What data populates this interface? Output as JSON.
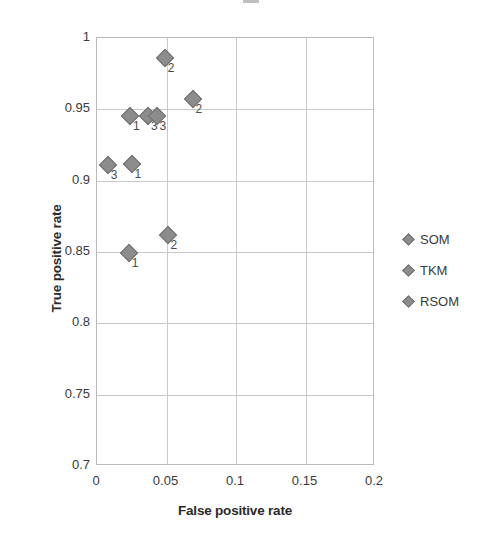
{
  "chart_data": {
    "type": "scatter",
    "title": "",
    "xlabel": "False positive rate",
    "ylabel": "True positive rate",
    "xlim": [
      0,
      0.2
    ],
    "ylim": [
      0.7,
      1
    ],
    "xticks": [
      "0",
      "0.05",
      "0.1",
      "0.15",
      "0.2"
    ],
    "xtick_values": [
      0,
      0.05,
      0.1,
      0.15,
      0.2
    ],
    "yticks": [
      "0.7",
      "0.75",
      "0.8",
      "0.85",
      "0.9",
      "0.95",
      "1"
    ],
    "ytick_values": [
      0.7,
      0.75,
      0.8,
      0.85,
      0.9,
      0.95,
      1
    ],
    "grid": true,
    "legend_position": "right",
    "marker_color": "#8c8c8c",
    "marker_edge_color": "#6f6f6f",
    "grid_color": "#c9c9c9",
    "series": [
      {
        "name": "SOM",
        "point_label": "1",
        "points": [
          {
            "x": 0.024,
            "y": 0.945,
            "label": "1"
          },
          {
            "x": 0.025,
            "y": 0.912,
            "label": "1"
          },
          {
            "x": 0.023,
            "y": 0.849,
            "label": "1"
          }
        ]
      },
      {
        "name": "TKM",
        "point_label": "2",
        "points": [
          {
            "x": 0.049,
            "y": 0.986,
            "label": "2"
          },
          {
            "x": 0.069,
            "y": 0.957,
            "label": "2"
          },
          {
            "x": 0.051,
            "y": 0.862,
            "label": "2"
          }
        ]
      },
      {
        "name": "RSOM",
        "point_label": "3",
        "points": [
          {
            "x": 0.037,
            "y": 0.945,
            "label": "3"
          },
          {
            "x": 0.043,
            "y": 0.945,
            "label": "3"
          },
          {
            "x": 0.008,
            "y": 0.911,
            "label": "3"
          }
        ]
      }
    ]
  },
  "legend": {
    "items": [
      {
        "label": "SOM"
      },
      {
        "label": "TKM"
      },
      {
        "label": "RSOM"
      }
    ]
  }
}
